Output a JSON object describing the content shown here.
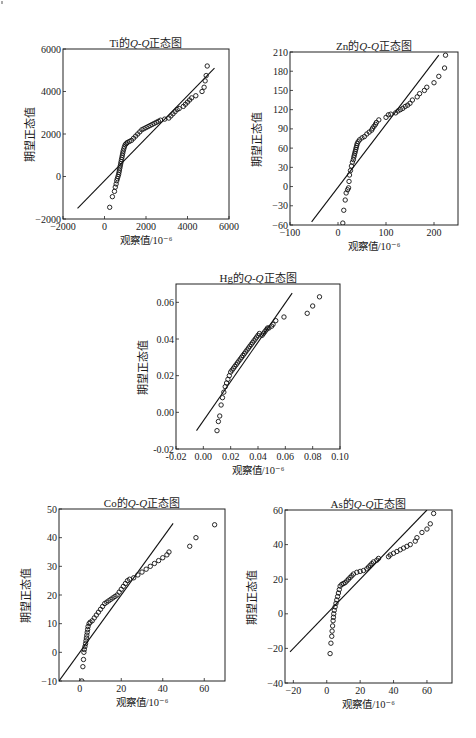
{
  "page": {
    "width": 476,
    "height": 738
  },
  "chart_data": [
    {
      "id": "ti",
      "type": "scatter",
      "title_prefix": "Ti的",
      "title_italic": "Q-Q",
      "title_suffix": "正态图",
      "title": "Ti的Q-Q正态图",
      "xlabel": "观察值/10⁻⁶",
      "ylabel": "期望正态值",
      "frame": {
        "left": 63,
        "top": 49,
        "right": 229,
        "bottom": 219
      },
      "xlim": [
        -2000,
        6000
      ],
      "ylim": [
        -2000,
        6000
      ],
      "xticks": [
        -2000,
        0,
        2000,
        4000,
        6000
      ],
      "yticks": [
        -2000,
        0,
        2000,
        4000,
        6000
      ],
      "grid": false,
      "reference_line": [
        [
          -1300,
          -1500
        ],
        [
          5300,
          5100
        ]
      ],
      "points": [
        [
          250,
          -1450
        ],
        [
          380,
          -950
        ],
        [
          480,
          -700
        ],
        [
          520,
          -500
        ],
        [
          560,
          -350
        ],
        [
          590,
          -200
        ],
        [
          620,
          -100
        ],
        [
          650,
          0
        ],
        [
          680,
          100
        ],
        [
          700,
          200
        ],
        [
          720,
          300
        ],
        [
          740,
          400
        ],
        [
          760,
          500
        ],
        [
          780,
          600
        ],
        [
          800,
          700
        ],
        [
          820,
          800
        ],
        [
          840,
          900
        ],
        [
          860,
          1000
        ],
        [
          880,
          1100
        ],
        [
          900,
          1200
        ],
        [
          930,
          1300
        ],
        [
          960,
          1400
        ],
        [
          1000,
          1500
        ],
        [
          1050,
          1550
        ],
        [
          1100,
          1600
        ],
        [
          1200,
          1650
        ],
        [
          1300,
          1700
        ],
        [
          1400,
          1800
        ],
        [
          1500,
          1900
        ],
        [
          1600,
          2000
        ],
        [
          1700,
          2100
        ],
        [
          1800,
          2200
        ],
        [
          1900,
          2250
        ],
        [
          2000,
          2300
        ],
        [
          2100,
          2350
        ],
        [
          2200,
          2400
        ],
        [
          2300,
          2450
        ],
        [
          2400,
          2500
        ],
        [
          2500,
          2550
        ],
        [
          2600,
          2600
        ],
        [
          2700,
          2650
        ],
        [
          2900,
          2700
        ],
        [
          3100,
          2750
        ],
        [
          3200,
          2850
        ],
        [
          3300,
          2950
        ],
        [
          3400,
          3050
        ],
        [
          3500,
          3150
        ],
        [
          3600,
          3200
        ],
        [
          3800,
          3300
        ],
        [
          3900,
          3400
        ],
        [
          4000,
          3500
        ],
        [
          4100,
          3600
        ],
        [
          4200,
          3700
        ],
        [
          4400,
          3800
        ],
        [
          4700,
          4000
        ],
        [
          4800,
          4200
        ],
        [
          4850,
          4500
        ],
        [
          4900,
          4750
        ],
        [
          4950,
          5200
        ]
      ]
    },
    {
      "id": "zn",
      "type": "scatter",
      "title_prefix": "Zn的",
      "title_italic": "Q-Q",
      "title_suffix": "正态图",
      "title": "Zn的Q-Q正态图",
      "xlabel": "观察值/10⁻⁶",
      "ylabel": "期望正态值",
      "frame": {
        "left": 290,
        "top": 52,
        "right": 458,
        "bottom": 225
      },
      "xlim": [
        -100,
        250
      ],
      "ylim": [
        -60,
        210
      ],
      "xticks": [
        -100,
        0,
        100,
        200
      ],
      "yticks": [
        -60,
        -30,
        0,
        30,
        60,
        90,
        120,
        150,
        180,
        210
      ],
      "grid": false,
      "reference_line": [
        [
          -55,
          -55
        ],
        [
          210,
          205
        ]
      ],
      "points": [
        [
          10,
          -57
        ],
        [
          12,
          -37
        ],
        [
          15,
          -21
        ],
        [
          17,
          -10
        ],
        [
          20,
          -5
        ],
        [
          22,
          -2
        ],
        [
          23,
          8
        ],
        [
          24,
          18
        ],
        [
          26,
          25
        ],
        [
          28,
          32
        ],
        [
          30,
          38
        ],
        [
          32,
          42
        ],
        [
          33,
          46
        ],
        [
          34,
          49
        ],
        [
          35,
          52
        ],
        [
          36,
          55
        ],
        [
          37,
          58
        ],
        [
          38,
          61
        ],
        [
          39,
          64
        ],
        [
          40,
          67
        ],
        [
          42,
          70
        ],
        [
          45,
          73
        ],
        [
          50,
          76
        ],
        [
          55,
          78
        ],
        [
          60,
          82
        ],
        [
          65,
          85
        ],
        [
          70,
          88
        ],
        [
          72,
          91
        ],
        [
          75,
          94
        ],
        [
          78,
          97
        ],
        [
          80,
          100
        ],
        [
          85,
          104
        ],
        [
          100,
          108
        ],
        [
          105,
          112
        ],
        [
          110,
          113
        ],
        [
          120,
          115
        ],
        [
          125,
          118
        ],
        [
          130,
          120
        ],
        [
          135,
          122
        ],
        [
          140,
          125
        ],
        [
          145,
          127
        ],
        [
          150,
          130
        ],
        [
          155,
          135
        ],
        [
          165,
          140
        ],
        [
          170,
          145
        ],
        [
          180,
          150
        ],
        [
          185,
          155
        ],
        [
          200,
          162
        ],
        [
          210,
          172
        ],
        [
          222,
          185
        ],
        [
          224,
          205
        ]
      ]
    },
    {
      "id": "hg",
      "type": "scatter",
      "title_prefix": "Hg的",
      "title_italic": "Q-Q",
      "title_suffix": "正态图",
      "title": "Hg的Q-Q正态图",
      "xlabel": "观察值/10⁻⁶",
      "ylabel": "期望正态值",
      "frame": {
        "left": 176,
        "top": 284,
        "right": 340,
        "bottom": 449
      },
      "xlim": [
        -0.02,
        0.1
      ],
      "ylim": [
        -0.02,
        0.07
      ],
      "xticks": [
        -0.02,
        0.0,
        0.02,
        0.04,
        0.06,
        0.08,
        0.1
      ],
      "xtick_labels": [
        "-0.02",
        "0.00",
        "0.02",
        "0.04",
        "0.06",
        "0.08",
        "0.10"
      ],
      "yticks": [
        -0.02,
        0.0,
        0.02,
        0.04,
        0.06
      ],
      "ytick_labels": [
        "-0.02",
        "0.00",
        "0.02",
        "0.04",
        "0.06"
      ],
      "grid": false,
      "reference_line": [
        [
          -0.005,
          -0.01
        ],
        [
          0.065,
          0.065
        ]
      ],
      "points": [
        [
          0.01,
          -0.01
        ],
        [
          0.011,
          -0.005
        ],
        [
          0.012,
          -0.002
        ],
        [
          0.013,
          0.004
        ],
        [
          0.014,
          0.008
        ],
        [
          0.015,
          0.011
        ],
        [
          0.016,
          0.014
        ],
        [
          0.017,
          0.016
        ],
        [
          0.018,
          0.018
        ],
        [
          0.019,
          0.02
        ],
        [
          0.02,
          0.022
        ],
        [
          0.021,
          0.023
        ],
        [
          0.022,
          0.024
        ],
        [
          0.023,
          0.025
        ],
        [
          0.024,
          0.026
        ],
        [
          0.025,
          0.027
        ],
        [
          0.026,
          0.028
        ],
        [
          0.027,
          0.029
        ],
        [
          0.028,
          0.03
        ],
        [
          0.029,
          0.031
        ],
        [
          0.03,
          0.032
        ],
        [
          0.031,
          0.033
        ],
        [
          0.032,
          0.034
        ],
        [
          0.033,
          0.035
        ],
        [
          0.034,
          0.036
        ],
        [
          0.035,
          0.037
        ],
        [
          0.036,
          0.038
        ],
        [
          0.037,
          0.039
        ],
        [
          0.038,
          0.04
        ],
        [
          0.039,
          0.041
        ],
        [
          0.04,
          0.042
        ],
        [
          0.041,
          0.043
        ],
        [
          0.043,
          0.042
        ],
        [
          0.044,
          0.043
        ],
        [
          0.045,
          0.044
        ],
        [
          0.046,
          0.045
        ],
        [
          0.047,
          0.046
        ],
        [
          0.048,
          0.046
        ],
        [
          0.05,
          0.047
        ],
        [
          0.051,
          0.048
        ],
        [
          0.053,
          0.05
        ],
        [
          0.059,
          0.052
        ],
        [
          0.076,
          0.054
        ],
        [
          0.08,
          0.058
        ],
        [
          0.085,
          0.063
        ]
      ]
    },
    {
      "id": "co",
      "type": "scatter",
      "title_prefix": "Co的",
      "title_italic": "Q-Q",
      "title_suffix": "正态图",
      "title": "Co的Q-Q正态图",
      "xlabel": "观察值/10⁻⁶",
      "ylabel": "期望正态值",
      "frame": {
        "left": 59,
        "top": 509,
        "right": 225,
        "bottom": 681
      },
      "xlim": [
        -10,
        70
      ],
      "ylim": [
        -10,
        50
      ],
      "xticks": [
        0,
        20,
        40,
        60
      ],
      "yticks": [
        -10,
        0,
        10,
        20,
        30,
        40,
        50
      ],
      "grid": false,
      "reference_line": [
        [
          -10,
          -10
        ],
        [
          45,
          45
        ]
      ],
      "points": [
        [
          1,
          -10
        ],
        [
          1.5,
          -5
        ],
        [
          1.8,
          -2.5
        ],
        [
          2,
          0
        ],
        [
          2.2,
          1
        ],
        [
          2.5,
          2
        ],
        [
          2.8,
          3
        ],
        [
          3,
          4
        ],
        [
          3.2,
          5
        ],
        [
          3.4,
          6
        ],
        [
          3.6,
          7
        ],
        [
          3.8,
          8
        ],
        [
          4,
          9
        ],
        [
          4.5,
          10
        ],
        [
          5,
          10.5
        ],
        [
          6,
          11
        ],
        [
          7,
          12
        ],
        [
          8,
          13
        ],
        [
          9,
          14
        ],
        [
          10,
          15
        ],
        [
          11,
          16
        ],
        [
          12,
          17
        ],
        [
          13,
          17.5
        ],
        [
          14,
          18
        ],
        [
          15,
          18.5
        ],
        [
          16,
          19
        ],
        [
          17,
          19.5
        ],
        [
          18,
          20
        ],
        [
          19,
          21
        ],
        [
          20,
          22
        ],
        [
          21,
          23
        ],
        [
          22,
          24
        ],
        [
          23,
          25
        ],
        [
          24,
          25.5
        ],
        [
          26,
          26
        ],
        [
          28,
          27
        ],
        [
          30,
          28
        ],
        [
          32,
          29
        ],
        [
          34,
          30
        ],
        [
          36,
          31
        ],
        [
          38,
          32
        ],
        [
          40,
          33
        ],
        [
          42,
          34
        ],
        [
          43,
          35
        ],
        [
          53,
          37
        ],
        [
          56,
          40
        ],
        [
          65,
          44.5
        ]
      ]
    },
    {
      "id": "as",
      "type": "scatter",
      "title_prefix": "As的",
      "title_italic": "Q-Q",
      "title_suffix": "正态图",
      "title": "As的Q-Q正态图",
      "xlabel": "观察值/10⁻⁶",
      "ylabel": "期望正态值",
      "frame": {
        "left": 285,
        "top": 510,
        "right": 452,
        "bottom": 683
      },
      "xlim": [
        -25,
        75
      ],
      "ylim": [
        -40,
        60
      ],
      "xticks": [
        -20,
        0,
        20,
        40,
        60
      ],
      "yticks": [
        -40,
        -20,
        0,
        20,
        40,
        60
      ],
      "grid": false,
      "reference_line": [
        [
          -22,
          -22
        ],
        [
          60,
          60
        ]
      ],
      "points": [
        [
          2,
          -23
        ],
        [
          2.5,
          -17
        ],
        [
          3,
          -13
        ],
        [
          3.2,
          -10
        ],
        [
          3.5,
          -7
        ],
        [
          3.8,
          -4
        ],
        [
          4,
          -2
        ],
        [
          4.2,
          0
        ],
        [
          4.5,
          2
        ],
        [
          5,
          4
        ],
        [
          5.5,
          6
        ],
        [
          6,
          8
        ],
        [
          6.5,
          10
        ],
        [
          7,
          12
        ],
        [
          7.5,
          14
        ],
        [
          8,
          16
        ],
        [
          9,
          17
        ],
        [
          10,
          17.5
        ],
        [
          11,
          18
        ],
        [
          12,
          19
        ],
        [
          13,
          20
        ],
        [
          14,
          21
        ],
        [
          15,
          22
        ],
        [
          16,
          23
        ],
        [
          18,
          24
        ],
        [
          20,
          24.5
        ],
        [
          22,
          25
        ],
        [
          24,
          26
        ],
        [
          25,
          27
        ],
        [
          26,
          28
        ],
        [
          27,
          29
        ],
        [
          28,
          30
        ],
        [
          30,
          31
        ],
        [
          31,
          32
        ],
        [
          37,
          33
        ],
        [
          38,
          34
        ],
        [
          40,
          35
        ],
        [
          42,
          36
        ],
        [
          44,
          37
        ],
        [
          46,
          38
        ],
        [
          48,
          39
        ],
        [
          50,
          40
        ],
        [
          53,
          42
        ],
        [
          54,
          44
        ],
        [
          57,
          47
        ],
        [
          60,
          49
        ],
        [
          62,
          52
        ],
        [
          64,
          58
        ]
      ]
    }
  ]
}
